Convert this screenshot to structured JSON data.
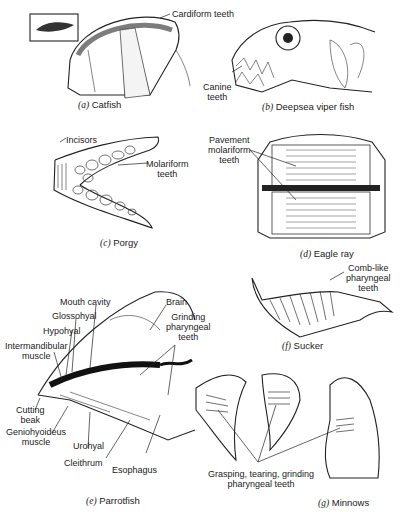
{
  "figure": {
    "panels": [
      {
        "id": "a",
        "letter": "(a)",
        "name": "Catfish",
        "labels": [
          "Cardiform teeth"
        ]
      },
      {
        "id": "b",
        "letter": "(b)",
        "name": "Deepsea viper fish",
        "labels": [
          "Canine",
          "teeth"
        ]
      },
      {
        "id": "c",
        "letter": "(c)",
        "name": "Porgy",
        "labels": [
          "Incisors",
          "Molariform",
          "teeth"
        ]
      },
      {
        "id": "d",
        "letter": "(d)",
        "name": "Eagle ray",
        "labels": [
          "Pavement",
          "molariform",
          "teeth"
        ]
      },
      {
        "id": "e",
        "letter": "(e)",
        "name": "Parrotfish",
        "labels": [
          "Mouth cavity",
          "Glossohyal",
          "Hypohyal",
          "Intermandibular",
          "muscle",
          "Cutting",
          "beak",
          "Geniohyoideus",
          "muscle",
          "Urohyal",
          "Cleithrum",
          "Esophagus",
          "Brain",
          "Grinding",
          "pharyngeal",
          "teeth"
        ]
      },
      {
        "id": "f",
        "letter": "(f)",
        "name": "Sucker",
        "labels": [
          "Comb-like",
          "pharyngeal",
          "teeth"
        ]
      },
      {
        "id": "g",
        "letter": "(g)",
        "name": "Minnows",
        "labels": [
          "Grasping, tearing, grinding",
          "pharyngeal teeth"
        ]
      }
    ]
  }
}
